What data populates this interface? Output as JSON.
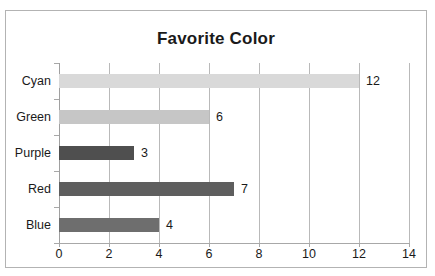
{
  "chart_data": {
    "type": "bar",
    "orientation": "horizontal",
    "title": "Favorite Color",
    "xlabel": "",
    "ylabel": "",
    "categories": [
      "Cyan",
      "Green",
      "Purple",
      "Red",
      "Blue"
    ],
    "values": [
      12,
      6,
      3,
      7,
      4
    ],
    "value_labels": [
      "12",
      "6",
      "3",
      "7",
      "4"
    ],
    "bar_colors": [
      "#d9d9d9",
      "#c6c6c6",
      "#4f4f4f",
      "#5e5e5e",
      "#6e6e6e"
    ],
    "xlim": [
      0,
      14
    ],
    "xticks": [
      0,
      2,
      4,
      6,
      8,
      10,
      12,
      14
    ],
    "xtick_labels": [
      "0",
      "2",
      "4",
      "6",
      "8",
      "10",
      "12",
      "14"
    ],
    "grid": true,
    "grid_axis": "x",
    "legend": false,
    "data_labels": true,
    "frame_color": "#b3b3b3",
    "gridline_color": "#b9b9b9",
    "axis_color": "#a8a8a8",
    "text_color": "#1a1a1a",
    "background": "#ffffff"
  }
}
